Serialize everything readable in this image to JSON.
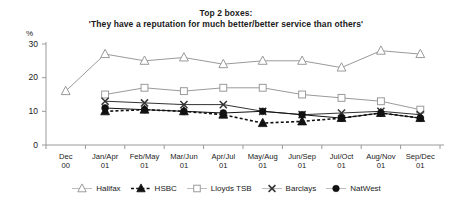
{
  "chart_data": {
    "type": "line",
    "title": "Top 2 boxes:",
    "subtitle": "'They have a reputation for much better/better service than others'",
    "xlabel": "",
    "ylabel": "%",
    "ylim": [
      0,
      30
    ],
    "yticks": [
      0,
      10,
      20,
      30
    ],
    "grid": false,
    "legend_position": "bottom",
    "categories": [
      "Dec 00",
      "Jan/Apr 01",
      "Feb/May 01",
      "Mar/Jun 01",
      "Apr/Jul 01",
      "May/Aug 01",
      "Jun/Sep 01",
      "Jul/Oct 01",
      "Aug/Nov 01",
      "Sep/Dec 01"
    ],
    "category_lines": [
      [
        "Dec",
        "00"
      ],
      [
        "Jan/Apr",
        "01"
      ],
      [
        "Feb/May",
        "01"
      ],
      [
        "Mar/Jun",
        "01"
      ],
      [
        "Apr/Jul",
        "01"
      ],
      [
        "May/Aug",
        "01"
      ],
      [
        "Jun/Sep",
        "01"
      ],
      [
        "Jul/Oct",
        "01"
      ],
      [
        "Aug/Nov",
        "01"
      ],
      [
        "Sep/Dec",
        "01"
      ]
    ],
    "series": [
      {
        "name": "Halifax",
        "marker": "triangle-open",
        "dash": "solid",
        "color": "#8c8c8c",
        "values": [
          16,
          27,
          25,
          26,
          24,
          25,
          25,
          23,
          28,
          27
        ]
      },
      {
        "name": "HSBC",
        "marker": "triangle-filled",
        "dash": "dashed",
        "color": "#111111",
        "values": [
          null,
          10,
          10.5,
          10,
          9,
          6.5,
          7,
          8,
          9.5,
          8
        ]
      },
      {
        "name": "Lloyds TSB",
        "marker": "square-open",
        "dash": "solid",
        "color": "#8c8c8c",
        "values": [
          null,
          15,
          17,
          16,
          17,
          17,
          15,
          14,
          13,
          10.5
        ]
      },
      {
        "name": "Barclays",
        "marker": "cross",
        "dash": "solid",
        "color": "#333333",
        "values": [
          null,
          13,
          12.5,
          12,
          12,
          10,
          9,
          9.5,
          10,
          9
        ]
      },
      {
        "name": "NatWest",
        "marker": "circle-filled",
        "dash": "solid",
        "color": "#111111",
        "values": [
          null,
          11,
          10.5,
          10,
          9.5,
          10,
          9,
          8,
          9.5,
          8
        ]
      }
    ]
  },
  "axis": {
    "y_unit": "%",
    "y_tick_labels": [
      "0",
      "10",
      "20",
      "30"
    ]
  },
  "legend": {
    "items": [
      {
        "label": "Halifax"
      },
      {
        "label": "HSBC"
      },
      {
        "label": "Lloyds TSB"
      },
      {
        "label": "Barclays"
      },
      {
        "label": "NatWest"
      }
    ]
  }
}
